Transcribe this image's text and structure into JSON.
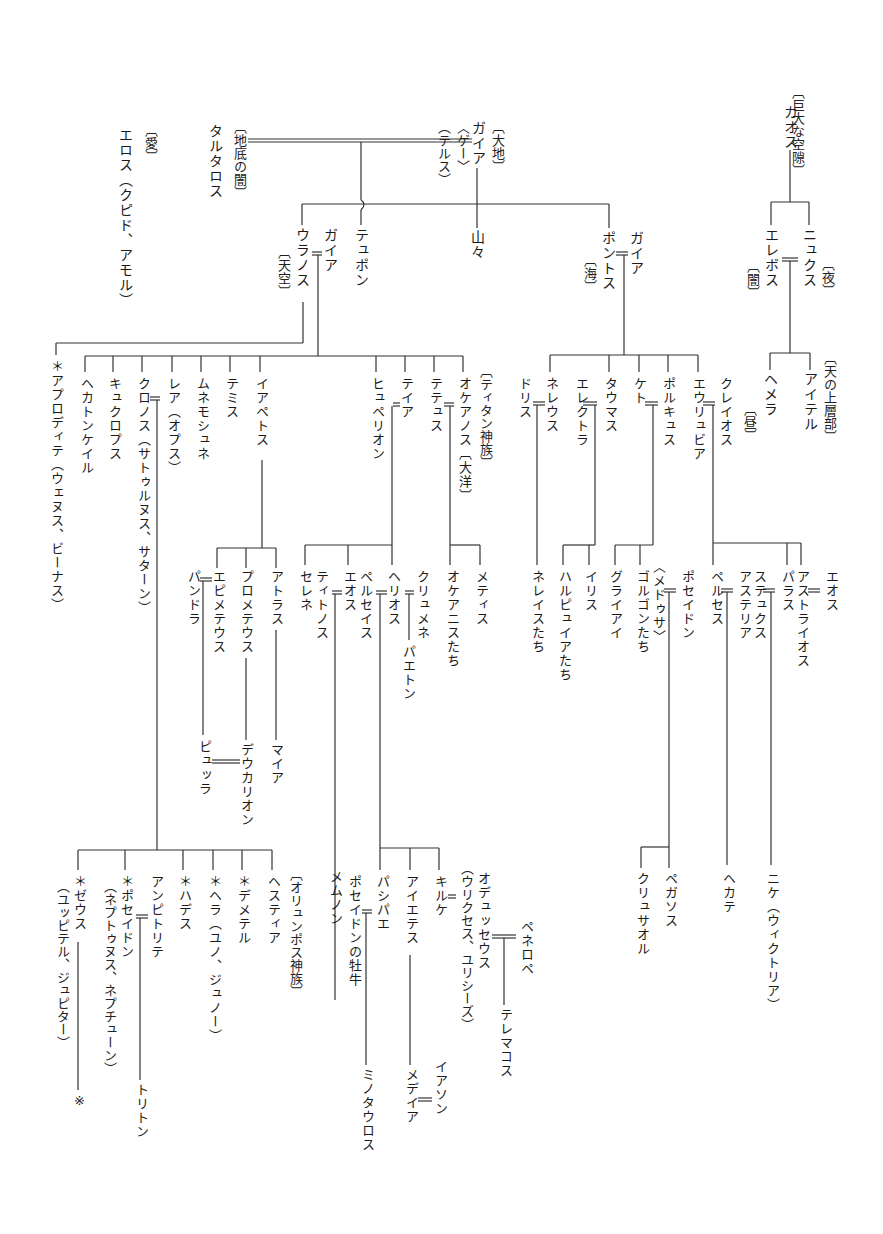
{
  "diagram": {
    "nodes": {
      "chaos_gloss": "〔巨大な空隙〕",
      "chaos": "カオス",
      "nyx": "ニュクス",
      "nyx_gloss": "〔夜〕",
      "erebos": "エレボス",
      "erebos_gloss": "〔闇〕",
      "aither_gloss": "〔天の上層部〕",
      "aither": "アイテル",
      "hemera": "ヘメラ",
      "hemera_gloss": "〔昼〕",
      "gaia_top_gloss": "〔大地〕",
      "gaia_top": "ガイア",
      "gaia_alt1": "〈ゲー〉",
      "gaia_alt2": "（テルス）",
      "tartaros_gloss": "〔地底の闇〕",
      "tartaros": "タルタロス",
      "eros_gloss": "〔愛〕",
      "eros": "エロス（クピド、アモル）",
      "typhon": "テュポン",
      "mountains": "山々",
      "uranos": "ウラノス",
      "uranos_gloss": "〔天空〕",
      "gaia_u": "ガイア",
      "pontos": "ポントス",
      "pontos_gloss": "〔海〕",
      "gaia_p": "ガイア",
      "titans_gloss": "〔ティタン神族〕",
      "okeanos": "オケアノス〔大洋〕",
      "tethys": "テテュス",
      "theia": "テイア",
      "hyperion": "ヒュペリオン",
      "iapetos": "イアペトス",
      "themis": "テミス",
      "mnemosyne": "ムネモシュネ",
      "rhea": "レア（オプス）",
      "kronos": "クロノス（サトゥルヌス、サターン）",
      "kyklopes": "キュクロプス",
      "hekatoncheires": "ヘカトンケイル",
      "aphrodite": "＊アプロディテ（ウェヌス、ビーナス）",
      "kreios": "クレイオス",
      "eurybia": "エウリュビア",
      "phorkys": "ポルキュス",
      "keto": "ケト",
      "thaumas": "タウマス",
      "elektra": "エレクトラ",
      "nereus": "ネレウス",
      "doris": "ドリス",
      "metis": "メティス",
      "okeanides": "オケアニスたち",
      "klymene": "クリュメネ",
      "helios": "ヘリオス",
      "phaethon": "パエトン",
      "perseis": "ペルセイス",
      "eos_h": "エオス",
      "tithonos": "ティトノス",
      "selene": "セレネ",
      "memnon": "メムノン",
      "atlas": "アトラス",
      "prometheus": "プロメテウス",
      "epimetheus": "エピメテウス",
      "pandora": "パンドラ",
      "maia": "マイア",
      "deukalion": "デウカリオン",
      "pyrrha": "ピュッラ",
      "eos_k": "エオス",
      "astraios": "アストライオス",
      "pallas": "パラス",
      "styx": "ステュクス",
      "asteria": "アステリア",
      "perses": "ペルセス",
      "poseidon_m": "ポセイドン",
      "medusa": "〈メドゥサ〉",
      "gorgons": "ゴルゴンたち",
      "graiai": "グライアイ",
      "iris": "イリス",
      "harpyiai": "ハルピュイアたち",
      "nereides": "ネレイスたち",
      "pegasos": "ペガソス",
      "chrysaor": "クリュサオル",
      "hekate": "ヘカテ",
      "nike": "ニケ（ウィクトリア）",
      "olympians_gloss": "〔オリュンポス神族〕",
      "hestia": "ヘスティア",
      "demeter": "＊デメテル",
      "hera": "＊ヘラ（ユノ、ジュノー）",
      "hades": "＊ハデス",
      "amphitrite": "アンピトリテ",
      "poseidon": "＊ポセイドン",
      "poseidon_alt": "（ネプトゥヌス、ネプチューン）",
      "zeus": "＊ゼウス",
      "zeus_alt": "（ユッピテル、ジュピター）",
      "zeus_note": "※",
      "triton": "トリトン",
      "kirke": "キルケ",
      "aietes": "アイエテス",
      "pasiphae": "パシパエ",
      "bull": "ポセイドンの牡牛",
      "odysseus": "オデュッセウス",
      "odysseus_alt": "（ウリクセス、ユリシーズ）",
      "penelope": "ペネロペ",
      "telemachos": "テレマコス",
      "medeia": "メデイア",
      "iason": "イアソン",
      "minotauros": "ミノタウロス"
    }
  }
}
